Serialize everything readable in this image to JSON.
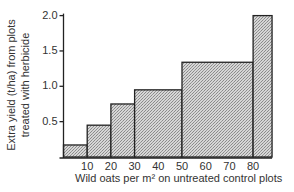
{
  "chart_data": {
    "type": "bar",
    "subtype": "histogram-step",
    "title": "",
    "xlabel": "Wild oats per m² on untreated control plots",
    "ylabel_line1": "Extra yield (t/ha) from plots",
    "ylabel_line2": "treated with herbicide",
    "ylabel": "Extra yield (t/ha) from plots treated with herbicide",
    "x_ticks": [
      "10",
      "20",
      "30",
      "40",
      "50",
      "60",
      "70",
      "80"
    ],
    "y_ticks": [
      "0.5",
      "1.0",
      "1.5",
      "2.0"
    ],
    "xlim": [
      0,
      90
    ],
    "ylim": [
      0,
      2.0
    ],
    "bins": [
      {
        "x_start": 0,
        "x_end": 10,
        "value": 0.17
      },
      {
        "x_start": 10,
        "x_end": 20,
        "value": 0.45
      },
      {
        "x_start": 20,
        "x_end": 30,
        "value": 0.75
      },
      {
        "x_start": 30,
        "x_end": 50,
        "value": 0.95
      },
      {
        "x_start": 50,
        "x_end": 80,
        "value": 1.34
      },
      {
        "x_start": 80,
        "x_end": 88,
        "value": 2.0
      }
    ],
    "categories": [
      "0-10",
      "10-20",
      "20-30",
      "30-50",
      "50-80",
      "80+"
    ],
    "values": [
      0.17,
      0.45,
      0.75,
      0.95,
      1.34,
      2.0
    ],
    "grid": false,
    "legend": null,
    "fill": "stippled grey"
  },
  "colors": {
    "bar_fill": "#bdbdbd",
    "bar_stroke": "#222222",
    "axis": "#222222"
  }
}
